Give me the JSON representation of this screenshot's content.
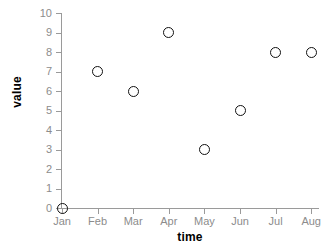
{
  "chart_data": {
    "type": "scatter",
    "title": "",
    "subtitle": "",
    "xlabel": "time",
    "ylabel": "value",
    "categories": [
      "Jan",
      "Feb",
      "Mar",
      "Apr",
      "May",
      "Jun",
      "Jul",
      "Aug"
    ],
    "values": [
      0,
      7,
      6,
      9,
      3,
      5,
      8,
      8
    ],
    "points": [
      {
        "x": "Jan",
        "y": 0
      },
      {
        "x": "Feb",
        "y": 7
      },
      {
        "x": "Mar",
        "y": 6
      },
      {
        "x": "Apr",
        "y": 9
      },
      {
        "x": "May",
        "y": 3
      },
      {
        "x": "Jun",
        "y": 5
      },
      {
        "x": "Jul",
        "y": 8
      },
      {
        "x": "Aug",
        "y": 8
      }
    ],
    "ylim": [
      0,
      10
    ],
    "yticks": [
      0,
      1,
      2,
      3,
      4,
      5,
      6,
      7,
      8,
      9,
      10
    ],
    "ytick_labels": [
      "0",
      "1",
      "2",
      "3",
      "4",
      "5",
      "6",
      "7",
      "8",
      "9",
      "10"
    ],
    "xtick_labels": [
      "Jan",
      "Feb",
      "Mar",
      "Apr",
      "May",
      "Jun",
      "Jul",
      "Aug"
    ],
    "grid": false,
    "legend": false,
    "legend_position": "none",
    "marker": "open-circle",
    "colors": {
      "background": "#ffffff",
      "marker_stroke": "#111111",
      "axis_line": "#9a9a9a",
      "tick_label": "#8c8c8c",
      "axis_title": "#000000"
    }
  }
}
